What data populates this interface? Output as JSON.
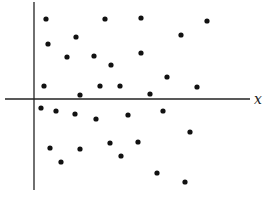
{
  "chart_data": {
    "type": "scatter",
    "title": "",
    "xlabel": "x",
    "ylabel": "",
    "grid": false,
    "legend": null,
    "axes": {
      "origin_px": [
        34,
        99
      ],
      "x_axis_px": {
        "from": 5,
        "to": 250,
        "y": 99
      },
      "y_axis_px": {
        "x": 34,
        "from": 2,
        "to": 190
      }
    },
    "points_px": [
      [
        46,
        19
      ],
      [
        105,
        19
      ],
      [
        141,
        18
      ],
      [
        207,
        21
      ],
      [
        181,
        35
      ],
      [
        48,
        44
      ],
      [
        76,
        37
      ],
      [
        94,
        56
      ],
      [
        141,
        53
      ],
      [
        111,
        65
      ],
      [
        67,
        57
      ],
      [
        44,
        86
      ],
      [
        80,
        95
      ],
      [
        100,
        86
      ],
      [
        120,
        86
      ],
      [
        167,
        77
      ],
      [
        197,
        87
      ],
      [
        150,
        94
      ],
      [
        41,
        108
      ],
      [
        56,
        111
      ],
      [
        75,
        114
      ],
      [
        96,
        119
      ],
      [
        128,
        115
      ],
      [
        163,
        111
      ],
      [
        50,
        148
      ],
      [
        80,
        149
      ],
      [
        61,
        162
      ],
      [
        110,
        143
      ],
      [
        121,
        156
      ],
      [
        190,
        132
      ],
      [
        138,
        142
      ],
      [
        157,
        173
      ],
      [
        185,
        182
      ]
    ],
    "point_color": "#111111",
    "axis_color": "#222222"
  }
}
